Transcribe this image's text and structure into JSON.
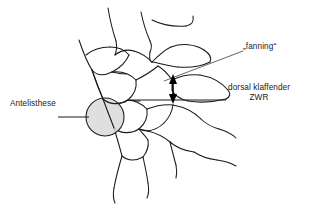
{
  "figure": {
    "type": "anatomical-line-diagram",
    "background_color": "#ffffff",
    "stroke_color": "#1a1a1a",
    "highlight_fill": "#d9d9d9"
  },
  "annotations": {
    "fanning": {
      "label": "„fanning“",
      "leader": "diagonal-line"
    },
    "dorsal_gap": {
      "line1": "dorsal klaffender",
      "line2": "ZWR",
      "leader": "horizontal-line"
    },
    "antelisthesis": {
      "label": "Antelisthese",
      "leader": "horizontal-line",
      "marker": "shaded-circle"
    }
  },
  "markers": {
    "double_arrow": {
      "name": "vertical-double-headed-arrow",
      "orientation": "vertical"
    },
    "highlight_circle": {
      "name": "shaded-highlight-circle",
      "fill": "#d9d9d9",
      "stroke": "#1a1a1a"
    }
  }
}
